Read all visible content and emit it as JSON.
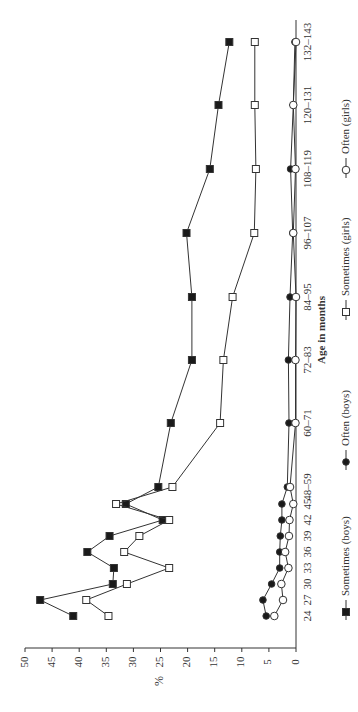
{
  "chart_data": {
    "type": "line",
    "orientation": "rotated-90-clockwise",
    "title": "",
    "xlabel": "Age in months",
    "ylabel": "%",
    "ylim": [
      0,
      50
    ],
    "yticks": [
      0,
      5,
      10,
      15,
      20,
      25,
      30,
      35,
      40,
      45,
      50
    ],
    "grid": false,
    "legend_position": "right (bottom of rotated chart)",
    "categories": [
      "24",
      "27",
      "30",
      "33",
      "36",
      "39",
      "42",
      "45",
      "48–59",
      "60–71",
      "72–83",
      "84–95",
      "96–107",
      "108–119",
      "120–131",
      "132–143"
    ],
    "series": [
      {
        "name": "Sometimes (boys)",
        "marker": "filled-square",
        "values": [
          41.1,
          47.2,
          33.8,
          33.6,
          38.5,
          34.4,
          24.6,
          31.4,
          25.4,
          23.1,
          19.2,
          19.2,
          20.2,
          15.9,
          14.3,
          12.3
        ]
      },
      {
        "name": "Often (boys)",
        "marker": "filled-circle",
        "values": [
          5.5,
          6.1,
          4.5,
          3.0,
          3.0,
          2.9,
          2.6,
          2.6,
          1.6,
          1.3,
          1.4,
          1.1,
          0.6,
          1.0,
          0.5,
          0.2
        ]
      },
      {
        "name": "Sometimes (girls)",
        "marker": "open-square",
        "values": [
          34.6,
          38.7,
          31.2,
          23.4,
          31.7,
          28.9,
          23.4,
          33.2,
          22.8,
          14.0,
          13.4,
          11.7,
          7.7,
          7.4,
          7.6,
          7.6
        ]
      },
      {
        "name": "Often (girls)",
        "marker": "open-circle",
        "values": [
          4.0,
          2.4,
          2.7,
          1.4,
          2.0,
          1.3,
          1.2,
          0.5,
          1.1,
          0.1,
          0.1,
          0.0,
          0.5,
          0.1,
          0.5,
          0.0
        ]
      }
    ]
  },
  "layout": {
    "axis_zero_x": 296,
    "px_per_unit": 5.42,
    "category_y": [
      616,
      600,
      584,
      568,
      552,
      536,
      520,
      504,
      487,
      423,
      360,
      297,
      233,
      169,
      105,
      42
    ],
    "line_color": "#333333",
    "fill_color": "#1a1a1a",
    "open_fill": "#ffffff"
  }
}
